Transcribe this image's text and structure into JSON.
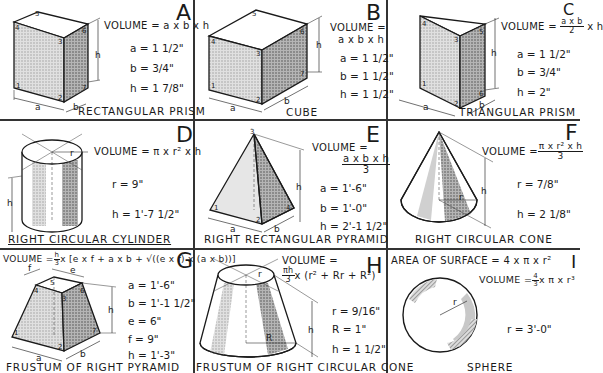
{
  "panels": {
    "A": {
      "letter": "A",
      "name": "RECTANGULAR PRISM",
      "formula": "VOLUME = a x b x h",
      "values": [
        "a = 1 1/2\"",
        "b = 3/4\"",
        "h = 1 7/8\""
      ],
      "dim_labels": {
        "a": "a",
        "b": "b",
        "h": "h"
      },
      "vertex_labels": [
        "1",
        "2",
        "3",
        "4",
        "5",
        "6",
        "7"
      ]
    },
    "B": {
      "letter": "B",
      "name": "CUBE",
      "formula_line1": "VOLUME =",
      "formula_line2": "a x b x h",
      "values": [
        "a = 1 1/2\"",
        "b = 1 1/2\"",
        "h = 1 1/2\""
      ],
      "dim_labels": {
        "a": "a",
        "b": "b",
        "h": "h"
      },
      "vertex_labels": [
        "1",
        "2",
        "3",
        "4",
        "5",
        "6",
        "7"
      ]
    },
    "C": {
      "letter": "C",
      "name": "TRIANGULAR PRISM",
      "formula_prefix": "VOLUME =",
      "formula_num": "a x b",
      "formula_den": "2",
      "formula_suffix": "x h",
      "values": [
        "a = 1 1/2\"",
        "b = 3/4\"",
        "h = 2\""
      ],
      "dim_labels": {
        "a": "a",
        "b": "b",
        "h": "h"
      },
      "vertex_labels": [
        "1",
        "2",
        "3",
        "4",
        "5",
        "6"
      ]
    },
    "D": {
      "letter": "D",
      "name": "RIGHT CIRCULAR CYLINDER",
      "formula": "VOLUME = π x r² x h",
      "values": [
        "r = 9\"",
        "h = 1'-7 1/2\""
      ],
      "dim_labels": {
        "r": "r",
        "h": "h"
      }
    },
    "E": {
      "letter": "E",
      "name": "RIGHT RECTANGULAR PYRAMID",
      "formula_line1": "VOLUME =",
      "formula_num": "a x b x h",
      "formula_den": "3",
      "values": [
        "a = 1'-6\"",
        "b = 1'-0\"",
        "h = 2'-1 1/2\""
      ],
      "dim_labels": {
        "a": "a",
        "b": "b",
        "h": "h"
      },
      "vertex_labels": [
        "1",
        "2",
        "3",
        "4"
      ]
    },
    "F": {
      "letter": "F",
      "name": "RIGHT CIRCULAR CONE",
      "formula_prefix": "VOLUME =",
      "formula_num": "π x r² x h",
      "formula_den": "3",
      "values": [
        "r = 7/8\"",
        "h = 2 1/8\""
      ],
      "dim_labels": {
        "r": "r",
        "h": "h"
      }
    },
    "G": {
      "letter": "G",
      "name": "FRUSTUM OF RIGHT PYRAMID",
      "formula": "VOLUME = h/3 x [(e x f) + a x b + √((e x f) x (a x b))]",
      "formula_prefix": "VOLUME =",
      "formula_h": "h",
      "formula_3": "3",
      "formula_body": "x [e x f + a x b + √((e x f) x (a x b))]",
      "values": [
        "a = 1'-6\"",
        "b = 1'-1 1/2\"",
        "e = 6\"",
        "f = 9\"",
        "h = 1'-3\""
      ],
      "dim_labels": {
        "a": "a",
        "b": "b",
        "e": "e",
        "f": "f",
        "h": "h"
      },
      "vertex_labels": [
        "1",
        "2",
        "3",
        "4",
        "5",
        "6",
        "7"
      ]
    },
    "H": {
      "letter": "H",
      "name": "FRUSTUM OF RIGHT CIRCULAR CONE",
      "formula_line1": "VOLUME =",
      "formula_num": "πh",
      "formula_den": "3",
      "formula_body": "x (r² + Rr + R²)",
      "values": [
        "r = 9/16\"",
        "R = 1\"",
        "h = 1 1/2\""
      ],
      "dim_labels": {
        "r": "r",
        "R": "R",
        "h": "h"
      }
    },
    "I": {
      "letter": "I",
      "name": "SPHERE",
      "surface_formula": "AREA OF SURFACE = 4 x π x r²",
      "formula_prefix": "VOLUME =",
      "formula_num": "4",
      "formula_den": "3",
      "formula_body": "x π x r³",
      "values": [
        "r = 3'-0\""
      ],
      "dim_labels": {
        "r": "r"
      }
    }
  },
  "colors": {
    "ink": "#1a1a1a",
    "grid": "#333333",
    "shade_light": "#c8c8c8",
    "shade_dark": "#8a8a8a",
    "paper": "#ffffff"
  }
}
